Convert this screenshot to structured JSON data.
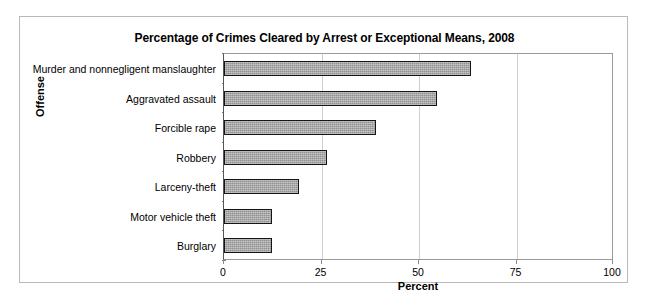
{
  "chart_data": {
    "type": "bar",
    "orientation": "horizontal",
    "title": "Percentage of Crimes Cleared by Arrest or Exceptional Means, 2008",
    "xlabel": "Percent",
    "ylabel": "Offense",
    "categories": [
      "Murder and nonnegligent manslaughter",
      "Aggravated assault",
      "Forcible rape",
      "Robbery",
      "Larceny-theft",
      "Motor vehicle theft",
      "Burglary"
    ],
    "values": [
      63.6,
      55.0,
      39.2,
      26.5,
      19.3,
      12.3,
      12.4
    ],
    "xlim": [
      0,
      100
    ],
    "xticks": [
      0,
      25,
      50,
      75,
      100
    ],
    "xtick_labels": [
      "0",
      "25",
      "50",
      "75",
      "100"
    ],
    "grid": "vertical",
    "legend": "none",
    "bar_color": "#a3a3a3",
    "bar_border_color": "#151515",
    "gridline_color": "#cfcfcf",
    "frame_color": "#b9b9b9",
    "text_color": "#000000"
  }
}
